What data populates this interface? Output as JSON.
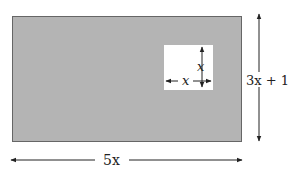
{
  "figure": {
    "type": "geometry-diagram",
    "colors": {
      "outer_fill": "#b4b4b4",
      "outer_stroke": "#555555",
      "inner_fill": "#ffffff",
      "arrow": "#222222"
    },
    "outer_rectangle": {
      "width_label": "5x",
      "height_label": "3x + 1"
    },
    "inner_square": {
      "side_label_horizontal": "x",
      "side_label_vertical": "x"
    }
  }
}
